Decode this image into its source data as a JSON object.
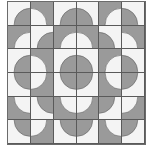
{
  "colors": {
    "light": "#f4f4f4",
    "dark": "#9a9a9a",
    "stroke": "#5a5a5a"
  },
  "grid": {
    "rows": 6,
    "cols": 6,
    "radius_ratio": 0.72,
    "cells": [
      [
        {
          "bg": "light",
          "corner": "BR"
        },
        {
          "bg": "dark",
          "corner": "BL"
        },
        {
          "bg": "light",
          "corner": "BR"
        },
        {
          "bg": "light",
          "corner": "BL"
        },
        {
          "bg": "dark",
          "corner": "BR"
        },
        {
          "bg": "light",
          "corner": "BL"
        }
      ],
      [
        {
          "bg": "dark",
          "corner": "BR"
        },
        {
          "bg": "light",
          "corner": "BR"
        },
        {
          "bg": "dark",
          "corner": "BR"
        },
        {
          "bg": "dark",
          "corner": "BL"
        },
        {
          "bg": "light",
          "corner": "BL"
        },
        {
          "bg": "dark",
          "corner": "BL"
        }
      ],
      [
        {
          "bg": "light",
          "corner": "BR"
        },
        {
          "bg": "dark",
          "corner": "BL"
        },
        {
          "bg": "light",
          "corner": "BR"
        },
        {
          "bg": "light",
          "corner": "BL"
        },
        {
          "bg": "dark",
          "corner": "BR"
        },
        {
          "bg": "light",
          "corner": "BL"
        }
      ],
      [
        {
          "bg": "light",
          "corner": "TR"
        },
        {
          "bg": "dark",
          "corner": "TL"
        },
        {
          "bg": "light",
          "corner": "TR"
        },
        {
          "bg": "light",
          "corner": "TL"
        },
        {
          "bg": "dark",
          "corner": "TR"
        },
        {
          "bg": "light",
          "corner": "TL"
        }
      ],
      [
        {
          "bg": "dark",
          "corner": "TR"
        },
        {
          "bg": "light",
          "corner": "TR"
        },
        {
          "bg": "dark",
          "corner": "TR"
        },
        {
          "bg": "dark",
          "corner": "TL"
        },
        {
          "bg": "light",
          "corner": "TL"
        },
        {
          "bg": "dark",
          "corner": "TL"
        }
      ],
      [
        {
          "bg": "light",
          "corner": "TR"
        },
        {
          "bg": "dark",
          "corner": "TL"
        },
        {
          "bg": "light",
          "corner": "TR"
        },
        {
          "bg": "light",
          "corner": "TL"
        },
        {
          "bg": "dark",
          "corner": "TR"
        },
        {
          "bg": "light",
          "corner": "TL"
        }
      ]
    ]
  }
}
